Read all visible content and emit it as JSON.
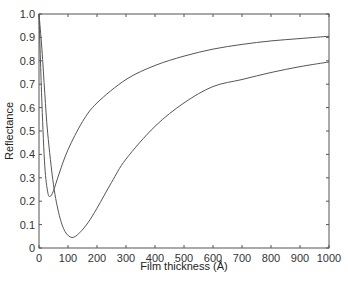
{
  "chart_data": {
    "type": "line",
    "title": "",
    "xlabel": "Film thickness (Å)",
    "ylabel": "Reflectance",
    "xlim": [
      0,
      1000
    ],
    "ylim": [
      0,
      1.0
    ],
    "grid": false,
    "legend": null,
    "x_ticks": [
      "0",
      "100",
      "200",
      "300",
      "400",
      "500",
      "600",
      "700",
      "800",
      "900",
      "1000"
    ],
    "y_ticks": [
      "0",
      "0.1",
      "0.2",
      "0.3",
      "0.4",
      "0.5",
      "0.6",
      "0.7",
      "0.8",
      "0.9",
      "1.0"
    ],
    "series": [
      {
        "name": "curve-upper",
        "x": [
          0,
          10,
          20,
          30,
          38,
          50,
          70,
          100,
          150,
          200,
          300,
          400,
          500,
          600,
          700,
          800,
          900,
          1000
        ],
        "y": [
          1.0,
          0.62,
          0.35,
          0.24,
          0.22,
          0.245,
          0.32,
          0.42,
          0.54,
          0.62,
          0.72,
          0.78,
          0.82,
          0.85,
          0.87,
          0.885,
          0.895,
          0.905
        ]
      },
      {
        "name": "curve-lower",
        "x": [
          0,
          10,
          20,
          30,
          50,
          70,
          90,
          114,
          140,
          170,
          200,
          250,
          300,
          400,
          500,
          600,
          700,
          800,
          900,
          1000
        ],
        "y": [
          1.0,
          0.85,
          0.66,
          0.49,
          0.27,
          0.14,
          0.07,
          0.045,
          0.065,
          0.11,
          0.17,
          0.28,
          0.38,
          0.52,
          0.62,
          0.69,
          0.72,
          0.75,
          0.775,
          0.795
        ]
      }
    ],
    "colors": {
      "line": "#555555",
      "axis": "#555555"
    }
  }
}
